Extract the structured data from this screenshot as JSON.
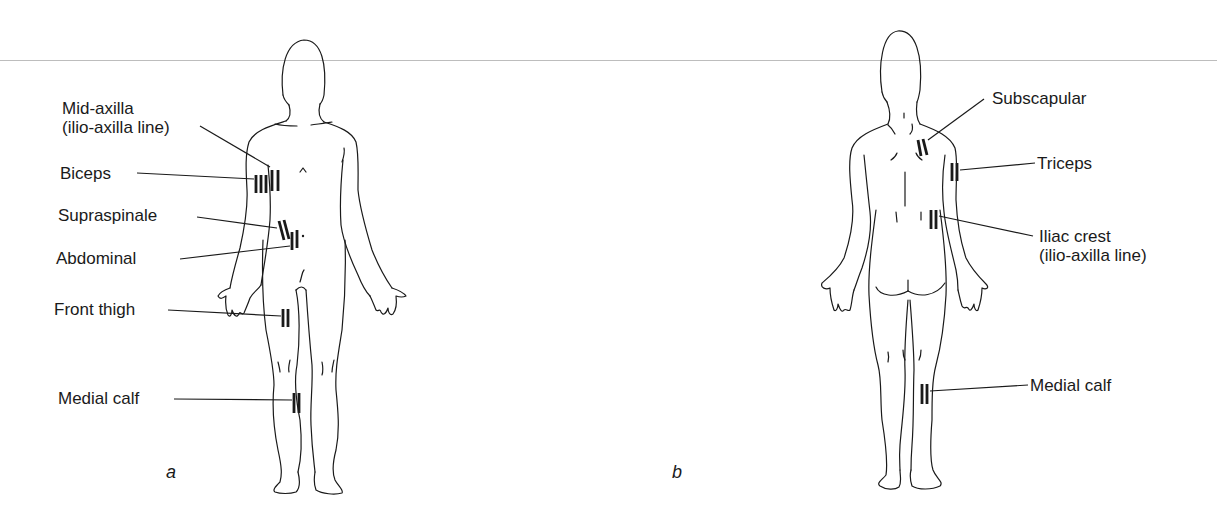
{
  "figure": {
    "panels": [
      {
        "id": "a",
        "letter": "a",
        "view": "front",
        "sites": [
          {
            "name": "Mid-axilla",
            "subtitle": "(ilio-axilla line)"
          },
          {
            "name": "Biceps"
          },
          {
            "name": "Supraspinale"
          },
          {
            "name": "Abdominal"
          },
          {
            "name": "Front thigh"
          },
          {
            "name": "Medial calf"
          }
        ]
      },
      {
        "id": "b",
        "letter": "b",
        "view": "back",
        "sites": [
          {
            "name": "Subscapular"
          },
          {
            "name": "Triceps"
          },
          {
            "name": "Iliac crest",
            "subtitle": "(ilio-axilla line)"
          },
          {
            "name": "Medial calf"
          }
        ]
      }
    ]
  },
  "colors": {
    "ink": "#1a1a1a",
    "rule": "#bdbdbd",
    "background": "#ffffff"
  }
}
